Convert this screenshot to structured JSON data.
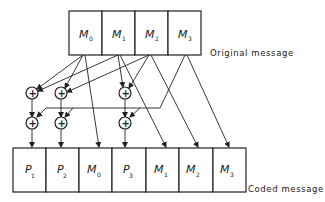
{
  "diagram": {
    "original": {
      "label": "Original message",
      "cells": [
        {
          "letter": "M",
          "sub": "0"
        },
        {
          "letter": "M",
          "sub": "1"
        },
        {
          "letter": "M",
          "sub": "2"
        },
        {
          "letter": "M",
          "sub": "3"
        }
      ]
    },
    "coded": {
      "label": "Coded message",
      "cells": [
        {
          "letter": "P",
          "sub": "1"
        },
        {
          "letter": "P",
          "sub": "2"
        },
        {
          "letter": "M",
          "sub": "0"
        },
        {
          "letter": "P",
          "sub": "3"
        },
        {
          "letter": "M",
          "sub": "1"
        },
        {
          "letter": "M",
          "sub": "2"
        },
        {
          "letter": "M",
          "sub": "3"
        }
      ]
    },
    "xor_symbol": "+",
    "gates": [
      "xor-p1-a",
      "xor-p2-a",
      "xor-p3-a",
      "xor-p1-b",
      "xor-p2-b",
      "xor-p3-b"
    ]
  }
}
